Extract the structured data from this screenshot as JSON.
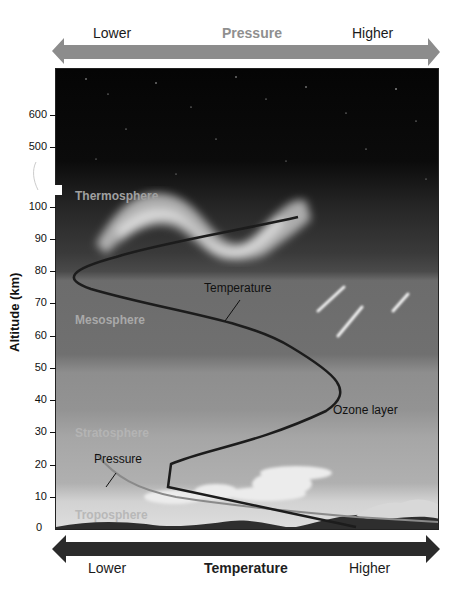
{
  "pressure_arrow": {
    "left_label": "Lower",
    "title": "Pressure",
    "right_label": "Higher",
    "color": "#8c8c8c"
  },
  "temperature_arrow": {
    "left_label": "Lower",
    "title": "Temperature",
    "right_label": "Higher",
    "color": "#2b2b2b"
  },
  "y_axis": {
    "label": "Altitude (km)",
    "ticks": [
      "600",
      "500",
      "100",
      "90",
      "80",
      "70",
      "60",
      "50",
      "40",
      "30",
      "20",
      "10",
      "0"
    ],
    "break": "axis break between 500 and 100"
  },
  "layers": {
    "thermosphere": "Thermosphere",
    "mesosphere": "Mesosphere",
    "stratosphere": "Stratosphere",
    "troposphere": "Troposphere"
  },
  "annotations": {
    "temperature": "Temperature",
    "pressure": "Pressure",
    "ozone": "Ozone layer"
  },
  "curves": {
    "temperature_color": "#1c1c1c",
    "pressure_color": "#8a8a8a"
  }
}
